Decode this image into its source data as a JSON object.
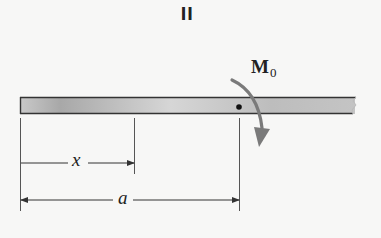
{
  "figure": {
    "panel_label": "II",
    "moment": {
      "symbol": "M",
      "subscript": "0",
      "direction": "clockwise",
      "color": "#7a7a7a"
    },
    "beam": {
      "fill_light": "#cfcfcf",
      "fill_dark": "#a9a9a9",
      "edge_color": "#3a3a3a",
      "right_end": "broken"
    },
    "dimensions": {
      "x_label": "x",
      "a_label": "a"
    },
    "point": "dot at distance a where moment M0 is applied"
  }
}
